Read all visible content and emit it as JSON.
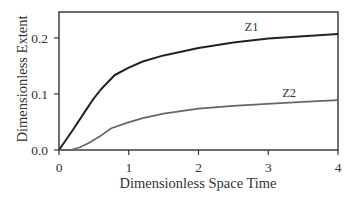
{
  "chart_data": {
    "type": "line",
    "title": "",
    "xlabel": "Dimensionless Space Time",
    "ylabel": "Dimensionless Extent",
    "xlim": [
      0,
      4
    ],
    "ylim": [
      0,
      0.245
    ],
    "xticks": [
      0,
      1,
      2,
      3,
      4
    ],
    "xtick_labels": [
      "0",
      "1",
      "2",
      "3",
      "4"
    ],
    "yticks": [
      0.0,
      0.1,
      0.2
    ],
    "ytick_labels": [
      "0.0",
      "0.1",
      "0.2"
    ],
    "grid": false,
    "legend": "inline labels on curves",
    "series": [
      {
        "name": "Z1",
        "color": "#222222",
        "label_pos": [
          2.76,
          0.212
        ],
        "x": [
          0,
          0.2,
          0.4,
          0.48,
          0.6,
          0.8,
          1.0,
          1.2,
          1.5,
          2.0,
          2.5,
          3.0,
          3.5,
          4.0
        ],
        "values": [
          0,
          0.036,
          0.074,
          0.089,
          0.108,
          0.134,
          0.147,
          0.158,
          0.169,
          0.182,
          0.192,
          0.199,
          0.203,
          0.207
        ]
      },
      {
        "name": "Z2",
        "color": "#666666",
        "label_pos": [
          3.3,
          0.094
        ],
        "x": [
          0,
          0.17,
          0.3,
          0.42,
          0.58,
          0.75,
          0.96,
          1.2,
          1.5,
          2.0,
          2.5,
          2.92,
          3.5,
          4.0
        ],
        "values": [
          0,
          0,
          0.005,
          0.012,
          0.024,
          0.039,
          0.048,
          0.057,
          0.065,
          0.074,
          0.079,
          0.082,
          0.086,
          0.089
        ]
      }
    ]
  },
  "labels": {
    "xlabel": "Dimensionless Space Time",
    "ylabel": "Dimensionless Extent",
    "z1": "Z1",
    "z2": "Z2"
  }
}
